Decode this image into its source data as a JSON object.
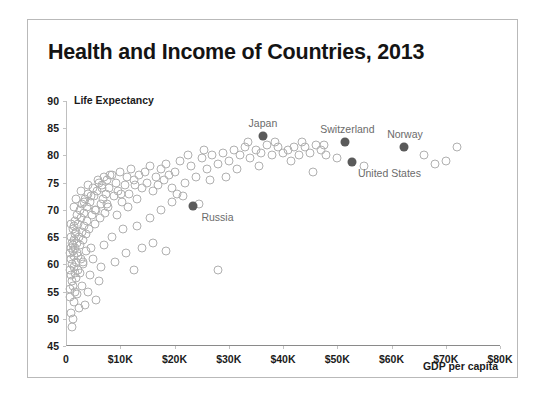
{
  "chart_data": {
    "type": "scatter",
    "title": "Health and Income of Countries, 2013",
    "xlabel": "GDP per capita",
    "ylabel": "Life Expectancy",
    "xlim": [
      0,
      80000
    ],
    "ylim": [
      45,
      90
    ],
    "grid": false,
    "legend": "none",
    "xticks": [
      {
        "value": 0,
        "label": "0"
      },
      {
        "value": 10000,
        "label": "$10K"
      },
      {
        "value": 20000,
        "label": "$20K"
      },
      {
        "value": 30000,
        "label": "$30K"
      },
      {
        "value": 40000,
        "label": "$40K"
      },
      {
        "value": 50000,
        "label": "$50K"
      },
      {
        "value": 60000,
        "label": "$60K"
      },
      {
        "value": 70000,
        "label": "$70K"
      },
      {
        "value": 80000,
        "label": "$80K"
      }
    ],
    "yticks": [
      {
        "value": 45,
        "label": "45"
      },
      {
        "value": 50,
        "label": "50"
      },
      {
        "value": 55,
        "label": "55"
      },
      {
        "value": 60,
        "label": "60"
      },
      {
        "value": 65,
        "label": "65"
      },
      {
        "value": 70,
        "label": "70"
      },
      {
        "value": 75,
        "label": "75"
      },
      {
        "value": 80,
        "label": "80"
      },
      {
        "value": 85,
        "label": "85"
      },
      {
        "value": 90,
        "label": "90"
      }
    ],
    "marker_colors": {
      "default": "#b0b0b0",
      "highlight": "#5a5a5a",
      "label_text": "#6b6b6b"
    },
    "highlighted": [
      {
        "name": "Japan",
        "x": 36300,
        "y": 83.6,
        "label_dx": 0,
        "label_dy": -13
      },
      {
        "name": "Switzerland",
        "x": 51500,
        "y": 82.5,
        "label_dx": 2,
        "label_dy": -13
      },
      {
        "name": "Norway",
        "x": 62300,
        "y": 81.6,
        "label_dx": 1,
        "label_dy": -13
      },
      {
        "name": "United States",
        "x": 52800,
        "y": 78.8,
        "label_dx": 37,
        "label_dy": 11
      },
      {
        "name": "Russia",
        "x": 23500,
        "y": 70.8,
        "label_dx": 24,
        "label_dy": 11
      }
    ],
    "points": [
      [
        700,
        59.0
      ],
      [
        760,
        62.0
      ],
      [
        820,
        55.5
      ],
      [
        880,
        63.0
      ],
      [
        900,
        58.0
      ],
      [
        950,
        65.0
      ],
      [
        1000,
        61.0
      ],
      [
        1050,
        57.0
      ],
      [
        1100,
        64.0
      ],
      [
        1150,
        60.0
      ],
      [
        1200,
        66.5
      ],
      [
        1250,
        56.0
      ],
      [
        1300,
        63.5
      ],
      [
        1350,
        62.5
      ],
      [
        1400,
        59.5
      ],
      [
        1450,
        67.0
      ],
      [
        1500,
        64.5
      ],
      [
        1550,
        61.5
      ],
      [
        1600,
        58.5
      ],
      [
        1650,
        65.5
      ],
      [
        1700,
        68.0
      ],
      [
        1750,
        63.0
      ],
      [
        1800,
        60.5
      ],
      [
        1850,
        66.0
      ],
      [
        1900,
        57.5
      ],
      [
        1950,
        69.0
      ],
      [
        2000,
        64.0
      ],
      [
        2100,
        62.0
      ],
      [
        2200,
        67.5
      ],
      [
        2300,
        59.0
      ],
      [
        2400,
        65.0
      ],
      [
        2500,
        70.0
      ],
      [
        2600,
        63.5
      ],
      [
        2700,
        61.0
      ],
      [
        2800,
        68.5
      ],
      [
        2900,
        66.0
      ],
      [
        3000,
        71.0
      ],
      [
        3100,
        64.5
      ],
      [
        3200,
        60.0
      ],
      [
        3300,
        69.5
      ],
      [
        3400,
        67.0
      ],
      [
        3500,
        72.0
      ],
      [
        3600,
        62.5
      ],
      [
        3700,
        65.5
      ],
      [
        3800,
        70.5
      ],
      [
        3900,
        68.0
      ],
      [
        4000,
        73.0
      ],
      [
        4200,
        66.5
      ],
      [
        4400,
        71.5
      ],
      [
        4600,
        63.0
      ],
      [
        4800,
        69.0
      ],
      [
        5000,
        74.0
      ],
      [
        5200,
        72.5
      ],
      [
        5400,
        67.5
      ],
      [
        5600,
        70.0
      ],
      [
        5800,
        73.5
      ],
      [
        6000,
        75.0
      ],
      [
        6200,
        68.5
      ],
      [
        6400,
        71.0
      ],
      [
        6600,
        74.5
      ],
      [
        6800,
        72.0
      ],
      [
        7000,
        76.0
      ],
      [
        7200,
        69.5
      ],
      [
        7400,
        73.0
      ],
      [
        7600,
        75.5
      ],
      [
        7800,
        70.5
      ],
      [
        8000,
        74.0
      ],
      [
        8400,
        76.5
      ],
      [
        8800,
        72.5
      ],
      [
        9200,
        75.0
      ],
      [
        9600,
        73.5
      ],
      [
        10000,
        77.0
      ],
      [
        10400,
        71.5
      ],
      [
        10800,
        74.5
      ],
      [
        11200,
        76.0
      ],
      [
        11600,
        73.0
      ],
      [
        12000,
        77.5
      ],
      [
        12500,
        75.5
      ],
      [
        13000,
        72.0
      ],
      [
        13500,
        76.5
      ],
      [
        14000,
        74.0
      ],
      [
        14500,
        77.0
      ],
      [
        15000,
        75.0
      ],
      [
        15500,
        78.0
      ],
      [
        16000,
        73.5
      ],
      [
        16500,
        76.0
      ],
      [
        17000,
        74.5
      ],
      [
        17500,
        77.5
      ],
      [
        18000,
        75.5
      ],
      [
        18500,
        78.5
      ],
      [
        19000,
        76.5
      ],
      [
        19500,
        74.0
      ],
      [
        20000,
        77.0
      ],
      [
        21000,
        79.0
      ],
      [
        22000,
        75.0
      ],
      [
        23000,
        78.0
      ],
      [
        24000,
        76.0
      ],
      [
        25000,
        79.5
      ],
      [
        26000,
        77.5
      ],
      [
        27000,
        80.0
      ],
      [
        28000,
        78.5
      ],
      [
        29000,
        80.5
      ],
      [
        30000,
        79.0
      ],
      [
        31000,
        81.0
      ],
      [
        32000,
        80.0
      ],
      [
        33000,
        81.5
      ],
      [
        34000,
        79.5
      ],
      [
        35000,
        81.0
      ],
      [
        36000,
        80.5
      ],
      [
        37000,
        82.0
      ],
      [
        38000,
        80.0
      ],
      [
        39000,
        81.5
      ],
      [
        40000,
        80.5
      ],
      [
        41000,
        81.0
      ],
      [
        42000,
        81.5
      ],
      [
        43000,
        80.0
      ],
      [
        44000,
        81.5
      ],
      [
        45000,
        80.5
      ],
      [
        46000,
        82.0
      ],
      [
        47000,
        81.0
      ],
      [
        48000,
        80.0
      ],
      [
        50000,
        79.5
      ],
      [
        55000,
        78.0
      ],
      [
        66000,
        80.0
      ],
      [
        68000,
        78.5
      ],
      [
        70000,
        79.0
      ],
      [
        72000,
        81.5
      ],
      [
        1100,
        48.5
      ],
      [
        2400,
        52.0
      ],
      [
        1500,
        53.0
      ],
      [
        5500,
        53.5
      ],
      [
        900,
        51.0
      ],
      [
        3000,
        56.0
      ],
      [
        4000,
        55.0
      ],
      [
        6500,
        59.5
      ],
      [
        12500,
        59.0
      ],
      [
        28000,
        59.0
      ],
      [
        9000,
        60.5
      ],
      [
        11000,
        62.0
      ],
      [
        14000,
        63.0
      ],
      [
        16000,
        64.0
      ],
      [
        18500,
        62.5
      ],
      [
        21500,
        72.5
      ],
      [
        24500,
        71.0
      ],
      [
        26500,
        75.5
      ],
      [
        8500,
        65.0
      ],
      [
        10500,
        66.5
      ],
      [
        7000,
        63.5
      ],
      [
        5000,
        61.0
      ],
      [
        13000,
        67.0
      ],
      [
        15500,
        68.5
      ],
      [
        17500,
        70.0
      ],
      [
        19500,
        71.5
      ],
      [
        4500,
        58.0
      ],
      [
        6000,
        57.0
      ],
      [
        2000,
        54.5
      ],
      [
        3500,
        52.5
      ],
      [
        1300,
        50.0
      ],
      [
        800,
        54.0
      ],
      [
        2600,
        58.5
      ],
      [
        3200,
        60.5
      ],
      [
        1700,
        55.0
      ],
      [
        2200,
        61.5
      ],
      [
        1000,
        67.5
      ],
      [
        1400,
        70.5
      ],
      [
        1900,
        72.0
      ],
      [
        2800,
        73.5
      ],
      [
        3400,
        71.5
      ],
      [
        4100,
        74.5
      ],
      [
        4700,
        72.5
      ],
      [
        5300,
        70.0
      ],
      [
        5900,
        75.5
      ],
      [
        6700,
        74.0
      ],
      [
        7500,
        71.0
      ],
      [
        8200,
        76.5
      ],
      [
        9400,
        69.0
      ],
      [
        10200,
        73.0
      ],
      [
        11500,
        70.5
      ],
      [
        12800,
        74.5
      ],
      [
        20500,
        73.0
      ],
      [
        22500,
        80.0
      ],
      [
        25500,
        81.0
      ],
      [
        29500,
        76.0
      ],
      [
        31500,
        77.5
      ],
      [
        33500,
        82.5
      ],
      [
        35500,
        78.0
      ],
      [
        38500,
        82.5
      ],
      [
        41500,
        79.0
      ],
      [
        43500,
        82.5
      ],
      [
        45500,
        77.0
      ],
      [
        47500,
        82.0
      ]
    ]
  }
}
